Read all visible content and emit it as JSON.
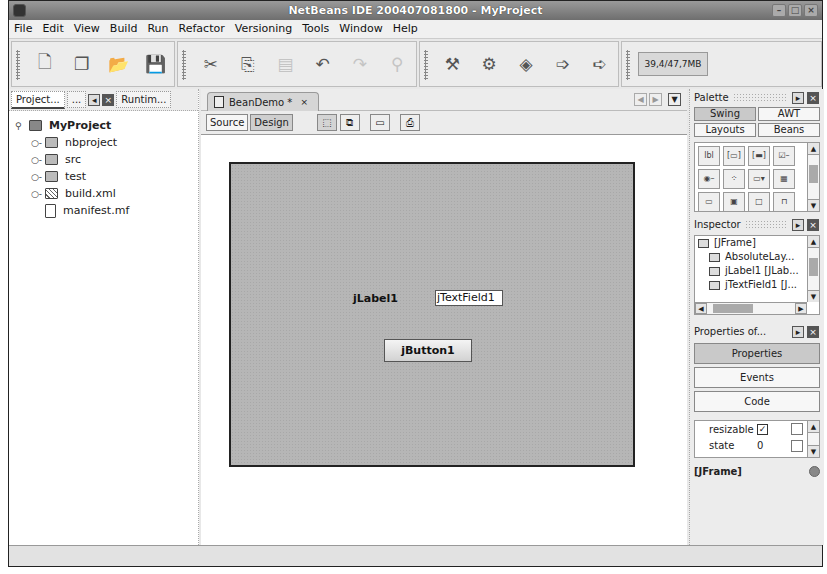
{
  "window": {
    "title": "NetBeans IDE 200407081800 - MyProject",
    "controls": [
      "minimize",
      "maximize",
      "close"
    ]
  },
  "menubar": {
    "items": [
      {
        "label": "File",
        "mnemonic": "F"
      },
      {
        "label": "Edit",
        "mnemonic": "E"
      },
      {
        "label": "View",
        "mnemonic": "V"
      },
      {
        "label": "Build",
        "mnemonic": "B"
      },
      {
        "label": "Run",
        "mnemonic": "R"
      },
      {
        "label": "Refactor",
        "mnemonic": "a"
      },
      {
        "label": "Versioning",
        "mnemonic": "s"
      },
      {
        "label": "Tools",
        "mnemonic": "T"
      },
      {
        "label": "Window",
        "mnemonic": "W"
      },
      {
        "label": "Help",
        "mnemonic": "H"
      }
    ]
  },
  "toolbar": {
    "file_group": [
      "new-file-icon",
      "new-project-icon",
      "open-project-icon",
      "save-all-icon"
    ],
    "edit_group": [
      "cut-icon",
      "copy-icon",
      "paste-icon",
      "undo-icon",
      "redo-icon",
      "find-icon"
    ],
    "build_group": [
      "build-icon",
      "clean-build-icon",
      "run-icon",
      "debug-icon",
      "run-file-icon"
    ],
    "memory": "39,4/47,7MB"
  },
  "left_pane": {
    "tabs": [
      {
        "label": "Project..."
      },
      {
        "label": "..."
      },
      {
        "label": "Runtim..."
      }
    ],
    "tree": {
      "root": "MyProject",
      "children": [
        {
          "label": "nbproject",
          "type": "folder"
        },
        {
          "label": "src",
          "type": "folder"
        },
        {
          "label": "test",
          "type": "folder"
        },
        {
          "label": "build.xml",
          "type": "xml"
        },
        {
          "label": "manifest.mf",
          "type": "file"
        }
      ]
    }
  },
  "editor": {
    "tab": {
      "label": "BeanDemo *",
      "close": "×"
    },
    "modes": {
      "source": "Source",
      "design": "Design"
    },
    "design_tools": [
      "selection-mode-icon",
      "connection-mode-icon",
      "preview-icon",
      "test-form-icon"
    ],
    "form": {
      "label": "jLabel1",
      "textfield": "jTextField1",
      "button": "jButton1"
    }
  },
  "palette": {
    "title": "Palette",
    "tabs": [
      {
        "label": "Swing",
        "active": true
      },
      {
        "label": "AWT",
        "active": false
      },
      {
        "label": "Layouts",
        "active": false
      },
      {
        "label": "Beans",
        "active": false
      }
    ],
    "components": [
      "label",
      "button",
      "toggle-button",
      "checkbox",
      "radio-button",
      "button-group",
      "combo-box",
      "list",
      "text-field",
      "text-area",
      "panel",
      "tabbed-pane"
    ]
  },
  "inspector": {
    "title": "Inspector",
    "nodes": [
      {
        "label": "[JFrame]",
        "level": 1
      },
      {
        "label": "AbsoluteLay...",
        "level": 2
      },
      {
        "label": "jLabel1 [JLab...",
        "level": 2
      },
      {
        "label": "jTextField1 [J...",
        "level": 2
      }
    ]
  },
  "properties": {
    "title": "Properties of...",
    "buttons": [
      {
        "label": "Properties",
        "active": true
      },
      {
        "label": "Events",
        "active": false
      },
      {
        "label": "Code",
        "active": false
      }
    ],
    "rows": [
      {
        "name": "resizable",
        "value": "✓"
      },
      {
        "name": "state",
        "value": "0"
      }
    ],
    "selected": "[JFrame]"
  }
}
